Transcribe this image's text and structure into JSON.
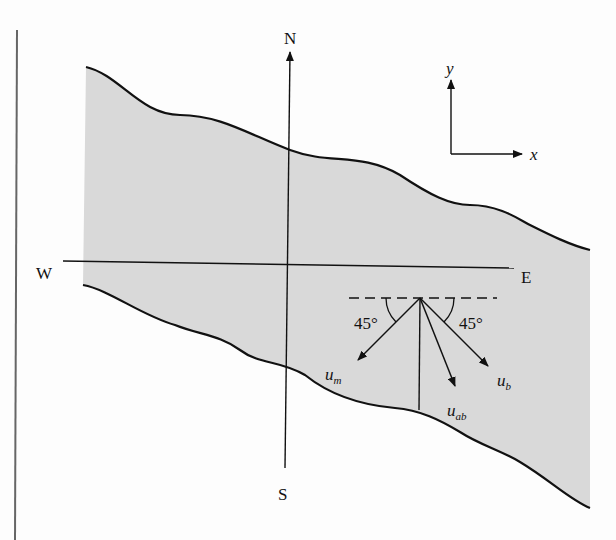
{
  "diagram": {
    "compass": {
      "north": "N",
      "south": "S",
      "west": "W",
      "east": "E"
    },
    "axes": {
      "x_label": "x",
      "y_label": "y"
    },
    "angles": {
      "left": "45°",
      "right": "45°"
    },
    "vectors": [
      {
        "name": "u",
        "subscript": "m"
      },
      {
        "name": "u",
        "subscript": "ab"
      },
      {
        "name": "u",
        "subscript": "b"
      }
    ],
    "colors": {
      "river_fill": "#d9d9d9",
      "line": "#111111",
      "page_bg": "#fdfdfd"
    }
  }
}
